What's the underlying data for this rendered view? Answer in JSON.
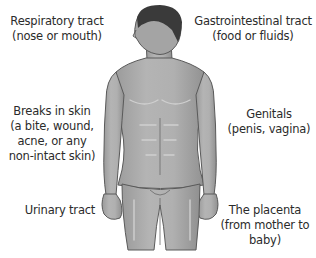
{
  "diagram": {
    "labels": [
      {
        "id": "respiratory",
        "title": "Respiratory tract",
        "lines": [
          "(nose or mouth)"
        ]
      },
      {
        "id": "gastrointestinal",
        "title": "Gastrointestinal tract",
        "lines": [
          "(food or fluids)"
        ]
      },
      {
        "id": "skin",
        "title": "Breaks in skin",
        "lines": [
          "(a bite, wound,",
          "acne, or any",
          "non-intact skin)"
        ]
      },
      {
        "id": "genitals",
        "title": "Genitals",
        "lines": [
          "(penis, vagina)"
        ]
      },
      {
        "id": "urinary",
        "title": "Urinary tract",
        "lines": []
      },
      {
        "id": "placenta",
        "title": "The placenta",
        "lines": [
          "(from mother to",
          "baby)"
        ]
      }
    ],
    "colors": {
      "text": "#2b2b2b",
      "skin": "#a9a9a9",
      "skin_shadow": "#8a8a8a",
      "skin_highlight": "#c8c8c8",
      "outline": "#5a5a5a",
      "hair": "#3a3a3a",
      "background": "#ffffff"
    }
  }
}
